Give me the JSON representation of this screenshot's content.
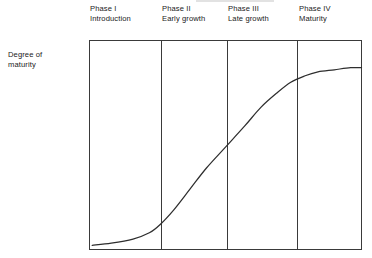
{
  "figure": {
    "y_axis_label": "Degree of\nmaturity",
    "curve_name": "s-curve-degree-of-maturity"
  },
  "phases": [
    {
      "line1": "Phase I",
      "line2": "Introduction"
    },
    {
      "line1": "Phase II",
      "line2": "Early growth"
    },
    {
      "line1": "Phase III",
      "line2": "Late growth"
    },
    {
      "line1": "Phase IV",
      "line2": "Maturity"
    }
  ],
  "chart_data": {
    "type": "line",
    "title": "",
    "xlabel": "",
    "ylabel": "Degree of maturity",
    "grid": false,
    "legend": null,
    "axis_ticks": {
      "x": [],
      "y": []
    },
    "xlim": [
      0,
      100
    ],
    "ylim": [
      0,
      100
    ],
    "phase_boundaries": [
      0,
      26.4,
      50.5,
      76.2,
      100
    ],
    "phase_labels": [
      "Phase I Introduction",
      "Phase II Early growth",
      "Phase III Late growth",
      "Phase IV Maturity"
    ],
    "series": [
      {
        "name": "Degree of maturity",
        "x": [
          1,
          8,
          16,
          22,
          26,
          31,
          37,
          43,
          50,
          57,
          63,
          69,
          74,
          79,
          84,
          90,
          96,
          100
        ],
        "y": [
          2,
          3,
          5,
          8,
          12,
          19,
          29,
          39,
          49,
          59,
          68,
          75,
          80,
          83,
          85,
          86,
          87,
          87
        ]
      }
    ],
    "annotations": [],
    "colors": {
      "line": "#2e2e2e",
      "frame": "#3a3a3a",
      "background": "#ffffff"
    }
  }
}
